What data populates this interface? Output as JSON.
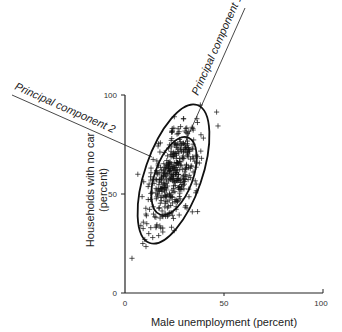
{
  "chart_data": {
    "type": "scatter",
    "title": "",
    "xlabel": "Male unemployment (percent)",
    "ylabel": "Households with no car",
    "ylabel_line2": "(percent)",
    "xlim": [
      0,
      100
    ],
    "ylim": [
      0,
      100
    ],
    "x_ticks": [
      0,
      50,
      100
    ],
    "y_ticks": [
      0,
      50,
      100
    ],
    "grid": false,
    "legend": null,
    "marker": "+",
    "annotations": [
      {
        "label": "Principal component 1",
        "from": [
          48,
          130
        ],
        "to": [
          30,
          75
        ]
      },
      {
        "label": "Principal component 2",
        "from": [
          -57,
          100
        ],
        "to": [
          13,
          69
        ]
      }
    ],
    "ellipses": [
      {
        "name": "outer",
        "center": [
          24.5,
          60
        ],
        "semi_major": 37,
        "semi_minor": 14.5,
        "angle_deg": 71
      },
      {
        "name": "inner",
        "center": [
          24.8,
          59
        ],
        "semi_major": 21,
        "semi_minor": 10,
        "angle_deg": 70
      }
    ],
    "point_cloud": {
      "n_approx": 400,
      "center": [
        24.5,
        60
      ],
      "description": "Dense positively-correlated cloud along principal component 1"
    },
    "outlier_points": [
      [
        29.5,
        88
      ],
      [
        12,
        30
      ],
      [
        10,
        27
      ],
      [
        9,
        25
      ],
      [
        14,
        28
      ],
      [
        17,
        29
      ],
      [
        34,
        41
      ],
      [
        36,
        55
      ],
      [
        33,
        63
      ],
      [
        11,
        35
      ],
      [
        13,
        33
      ],
      [
        8,
        34
      ]
    ]
  },
  "labels": {
    "pc1": "Principal component 1",
    "pc2": "Principal component 2",
    "xaxis": "Male unemployment (percent)",
    "yaxis_line1": "Households with no car",
    "yaxis_line2": "(percent)",
    "xt0": "0",
    "xt50": "50",
    "xt100": "100",
    "yt0": "0",
    "yt50": "50",
    "yt100": "100"
  }
}
